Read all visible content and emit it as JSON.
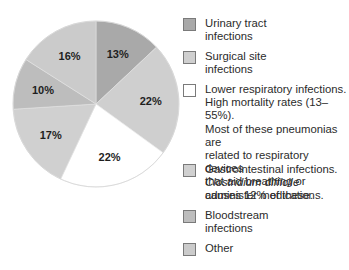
{
  "chart_data": {
    "type": "pie",
    "title": "",
    "start_angle": "12 o'clock",
    "direction": "clockwise",
    "slices": [
      {
        "label": "Urinary tract infections",
        "value": 13,
        "display": "13%",
        "color": "#a9a9a9"
      },
      {
        "label": "Surgical site infections",
        "value": 22,
        "display": "22%",
        "color": "#cfcfcf"
      },
      {
        "label": "Lower respiratory infections",
        "value": 22,
        "display": "22%",
        "color": "#ffffff"
      },
      {
        "label": "Gastrointestinal infections",
        "value": 17,
        "display": "17%",
        "color": "#d0d0d0"
      },
      {
        "label": "Bloodstream infections",
        "value": 10,
        "display": "10%",
        "color": "#bdbdbd"
      },
      {
        "label": "Other",
        "value": 16,
        "display": "16%",
        "color": "#cbcbcb"
      }
    ],
    "legend_position": "right"
  },
  "legend": {
    "items": [
      {
        "line1": "Urinary tract",
        "line2": "infections",
        "color": "#a9a9a9"
      },
      {
        "line1": "Surgical site",
        "line2": "infections",
        "color": "#cfcfcf"
      },
      {
        "line1": "Lower respiratory infections.",
        "line2": "High mortality rates (13–55%).",
        "line3": "Most of these pneumonias are",
        "line4": "related to respiratory devices",
        "line5": "that aid breathing or",
        "line6": "administer medications.",
        "color": "#ffffff"
      },
      {
        "line1": "Gastrointestinal infections.",
        "line2": "Clostridium difficile",
        "line3": "causes 12% of these.",
        "color": "#d0d0d0"
      },
      {
        "line1": "Bloodstream",
        "line2": "infections",
        "color": "#bdbdbd"
      },
      {
        "line1": "Other",
        "color": "#cbcbcb"
      }
    ]
  }
}
